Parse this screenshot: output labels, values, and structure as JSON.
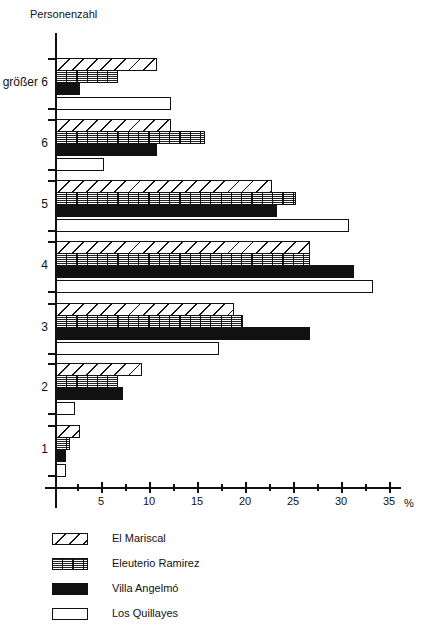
{
  "chart_data": {
    "type": "bar",
    "orientation": "horizontal",
    "title": "",
    "ylabel": "Personenzahl",
    "xlabel": "%",
    "xlim": [
      0,
      37
    ],
    "xticks": [
      5,
      10,
      15,
      20,
      25,
      30,
      35
    ],
    "grid": false,
    "legend_position": "bottom",
    "categories": [
      "größer 6",
      "6",
      "5",
      "4",
      "3",
      "2",
      "1"
    ],
    "series": [
      {
        "name": "El Mariscal",
        "pattern": "diagonal-hatch",
        "values": [
          10.5,
          12,
          22.5,
          26.5,
          18.5,
          9,
          2.5
        ]
      },
      {
        "name": "Eleuterio Ramirez",
        "pattern": "grid-hatch",
        "values": [
          6.5,
          15.5,
          25,
          26.5,
          19.5,
          6.5,
          1.5
        ]
      },
      {
        "name": "Villa Angelmó",
        "pattern": "solid-black",
        "values": [
          2.5,
          10.5,
          23,
          31,
          26.5,
          7,
          1
        ]
      },
      {
        "name": "Los Quillayes",
        "pattern": "white",
        "values": [
          12,
          5,
          30.5,
          33,
          17,
          2,
          1
        ]
      }
    ]
  },
  "labels": {
    "y_title": "Personenzahl",
    "x_unit": "%",
    "x_ticks": [
      "5",
      "10",
      "15",
      "20",
      "25",
      "30",
      "35"
    ],
    "categories": [
      "größer 6",
      "6",
      "5",
      "4",
      "3",
      "2",
      "1"
    ]
  },
  "legend": [
    {
      "label": "El Mariscal",
      "pattern": "diagonal-hatch"
    },
    {
      "label": "Eleuterio Ramirez",
      "pattern": "grid-hatch"
    },
    {
      "label": "Villa Angelmó",
      "pattern": "solid-black"
    },
    {
      "label": "Los Quillayes",
      "pattern": "white"
    }
  ]
}
